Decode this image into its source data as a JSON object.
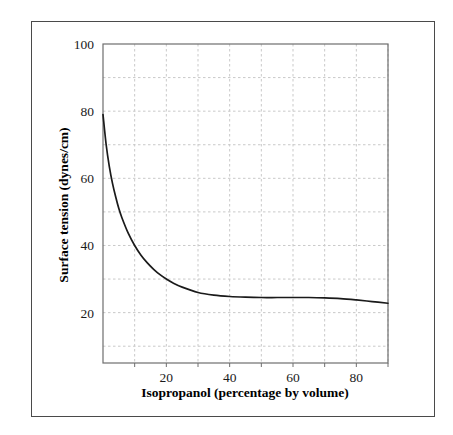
{
  "chart_data": {
    "type": "line",
    "title": "",
    "xlabel": "Isopropanol (percentage by volume)",
    "ylabel": "Surface tension (dynes/cm)",
    "xlim": [
      0,
      90
    ],
    "ylim": [
      5,
      100
    ],
    "xticks": [
      20,
      40,
      60,
      80
    ],
    "xtick_labels": [
      "20",
      "40",
      "60",
      "80"
    ],
    "yticks": [
      20,
      40,
      60,
      80,
      100
    ],
    "ytick_labels": [
      "20",
      "40",
      "60",
      "80",
      "100"
    ],
    "x_gridlines": [
      10,
      20,
      30,
      40,
      50,
      60,
      70,
      80,
      90
    ],
    "y_gridlines": [
      10,
      20,
      30,
      40,
      50,
      60,
      70,
      80,
      90
    ],
    "grid": true,
    "grid_style": "dashed",
    "grid_color": "#c9c9c9",
    "line_color": "#1a1a1a",
    "legend": null,
    "series": [
      {
        "name": "Surface tension of isopropanol-water mixtures",
        "x": [
          0,
          1,
          2,
          3,
          4,
          5,
          6,
          8,
          10,
          12,
          14,
          16,
          18,
          20,
          22,
          25,
          30,
          35,
          40,
          45,
          50,
          55,
          60,
          65,
          70,
          75,
          80,
          85,
          90
        ],
        "y": [
          79.0,
          70.0,
          63.5,
          58.5,
          54.5,
          51.0,
          48.2,
          43.6,
          40.0,
          37.1,
          34.8,
          32.9,
          31.3,
          30.0,
          28.9,
          27.6,
          26.0,
          25.2,
          24.8,
          24.6,
          24.5,
          24.5,
          24.5,
          24.5,
          24.4,
          24.2,
          23.8,
          23.3,
          22.8
        ]
      }
    ]
  },
  "figure": {
    "axis_color": "#6e6e6e",
    "frame_color": "#4a4a4a"
  }
}
